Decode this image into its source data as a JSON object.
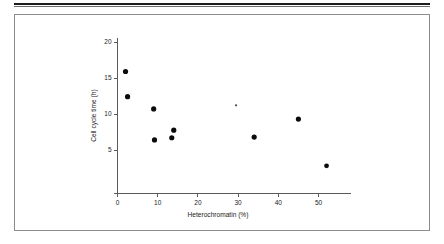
{
  "figure": {
    "border_color": "#8c8c8c",
    "rule_color": "#1d1d1d"
  },
  "chart_data": {
    "type": "scatter",
    "title": "",
    "xlabel": "Heterochromatin (%)",
    "ylabel": "Cell cycle time (h)",
    "xlim": [
      0,
      58
    ],
    "ylim": [
      0,
      20.6
    ],
    "xticks": [
      0,
      10,
      20,
      30,
      40,
      50
    ],
    "xtick_labels": [
      "0",
      "10",
      "20",
      "30",
      "40",
      "50"
    ],
    "yticks": [
      5,
      10,
      15,
      20
    ],
    "ytick_labels": [
      "5",
      "10",
      "15",
      "20"
    ],
    "grid": false,
    "legend": false,
    "marker_color": "#0b0b0b",
    "points": [
      {
        "x": 2.0,
        "y": 15.9,
        "size": 2.6
      },
      {
        "x": 2.5,
        "y": 12.4,
        "size": 2.6
      },
      {
        "x": 9.0,
        "y": 10.7,
        "size": 2.6
      },
      {
        "x": 9.2,
        "y": 6.4,
        "size": 2.6
      },
      {
        "x": 13.5,
        "y": 6.7,
        "size": 2.6
      },
      {
        "x": 14.0,
        "y": 7.75,
        "size": 2.6
      },
      {
        "x": 29.5,
        "y": 11.2,
        "size": 1.1
      },
      {
        "x": 34.0,
        "y": 6.8,
        "size": 2.6
      },
      {
        "x": 45.0,
        "y": 9.3,
        "size": 2.6
      },
      {
        "x": 52.0,
        "y": 2.8,
        "size": 2.4
      }
    ]
  }
}
